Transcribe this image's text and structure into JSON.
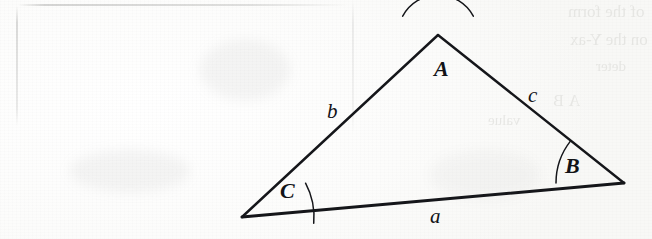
{
  "figure": {
    "ink_color": "#15161a",
    "paper_color": "#fdfdfc",
    "vertices": [
      {
        "id": "A",
        "label": "A",
        "role": "apex-top",
        "x": 438,
        "y": 35,
        "label_x": 434,
        "label_y": 58,
        "arc_radius": 40,
        "arc_start_deg": 208,
        "arc_end_deg": 332
      },
      {
        "id": "B",
        "label": "B",
        "role": "right",
        "x": 624,
        "y": 183,
        "label_x": 565,
        "label_y": 155,
        "arc_radius": 68,
        "arc_start_deg": 180,
        "arc_end_deg": 218
      },
      {
        "id": "C",
        "label": "C",
        "role": "bottom-left",
        "x": 242,
        "y": 217,
        "label_x": 280,
        "label_y": 180,
        "arc_radius": 72,
        "arc_start_deg": 332,
        "arc_end_deg": 5
      }
    ],
    "sides": [
      {
        "id": "a",
        "label": "a",
        "opposite_vertex": "A",
        "from": "C",
        "to": "B",
        "label_x": 430,
        "label_y": 206
      },
      {
        "id": "b",
        "label": "b",
        "opposite_vertex": "B",
        "from": "A",
        "to": "C",
        "label_x": 327,
        "label_y": 101
      },
      {
        "id": "c",
        "label": "c",
        "opposite_vertex": "C",
        "from": "A",
        "to": "B",
        "label_x": 528,
        "label_y": 85
      }
    ]
  },
  "background": {
    "bleed_text": [
      "of the form",
      "on the Y-ax",
      "deter",
      "A    B",
      "value"
    ]
  }
}
